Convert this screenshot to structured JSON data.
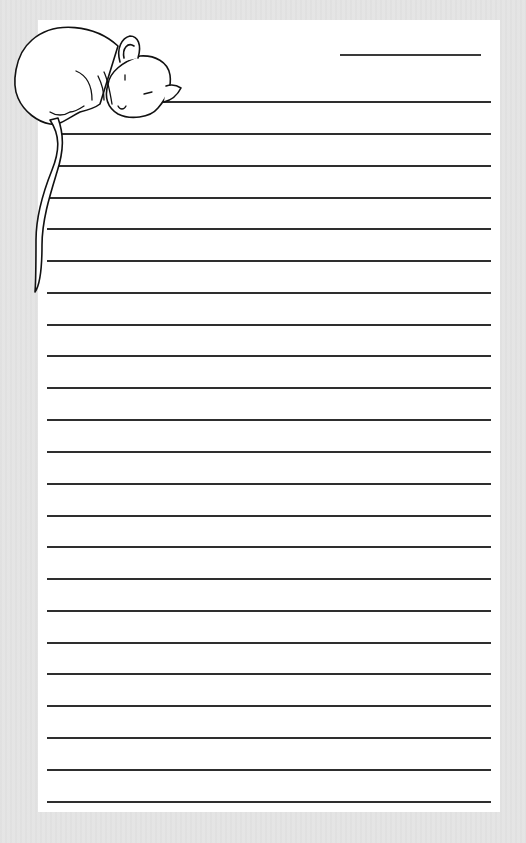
{
  "page": {
    "type": "lined stationery",
    "background_color": "#e4e4e4",
    "paper_color": "#ffffff",
    "rule_color": "#2e2e2e",
    "illustration": "sleeping-mouse",
    "header_line": {
      "purpose": "date-or-title line"
    },
    "line_count": 23
  },
  "lines": [
    {
      "y": 102,
      "x": 160
    },
    {
      "y": 134,
      "x": 58
    },
    {
      "y": 166,
      "x": 58
    },
    {
      "y": 198,
      "x": 47
    },
    {
      "y": 229,
      "x": 47
    },
    {
      "y": 261,
      "x": 47
    },
    {
      "y": 293,
      "x": 47
    },
    {
      "y": 325,
      "x": 47
    },
    {
      "y": 356,
      "x": 47
    },
    {
      "y": 388,
      "x": 47
    },
    {
      "y": 420,
      "x": 47
    },
    {
      "y": 452,
      "x": 47
    },
    {
      "y": 484,
      "x": 47
    },
    {
      "y": 516,
      "x": 47
    },
    {
      "y": 547,
      "x": 47
    },
    {
      "y": 579,
      "x": 47
    },
    {
      "y": 611,
      "x": 47
    },
    {
      "y": 643,
      "x": 47
    },
    {
      "y": 674,
      "x": 47
    },
    {
      "y": 706,
      "x": 47
    },
    {
      "y": 738,
      "x": 47
    },
    {
      "y": 770,
      "x": 47
    },
    {
      "y": 802,
      "x": 47
    }
  ]
}
